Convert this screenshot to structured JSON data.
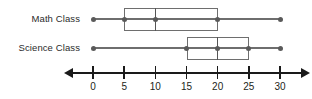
{
  "chart_data": {
    "type": "box",
    "title": "",
    "xlabel": "",
    "ylabel": "",
    "xlim": [
      0,
      30
    ],
    "grid": false,
    "legend": "none",
    "axis": {
      "ticks": [
        0,
        5,
        10,
        15,
        20,
        25,
        30
      ],
      "tick_labels": [
        "0",
        "5",
        "10",
        "15",
        "20",
        "25",
        "30"
      ],
      "arrows": [
        "left",
        "right"
      ]
    },
    "categories": [
      "Math Class",
      "Science Class"
    ],
    "series": [
      {
        "name": "Math Class",
        "min": 0,
        "q1": 5,
        "median": 10,
        "q3": 20,
        "max": 30
      },
      {
        "name": "Science Class",
        "min": 0,
        "q1": 15,
        "median": 20,
        "q3": 25,
        "max": 30
      }
    ]
  },
  "colors": {
    "axis": "#1a1a1a",
    "box_outline": "#6e6e6e",
    "whisker": "#6e6e6e",
    "marker": "#5a5a5a",
    "text": "#231f20",
    "background": "#ffffff"
  }
}
